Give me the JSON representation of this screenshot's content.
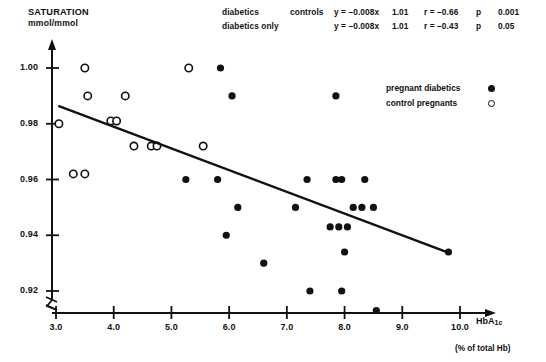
{
  "figure": {
    "y_axis_title": "SATURATION",
    "y_axis_unit": "mmol/mmol",
    "x_axis_title_main": "HbA",
    "x_axis_title_sub": "1c",
    "x_axis_unit": "(% of total Hb)"
  },
  "stats": {
    "rows": [
      {
        "group": "diabetics",
        "group2": "controls",
        "equation": "y = –0.008x",
        "intercept": "1.01",
        "r": "r = –0.66",
        "p_label": "p",
        "p_value": "0.001"
      },
      {
        "group": "diabetics only",
        "group2": "",
        "equation": "y = –0.008x",
        "intercept": "1.01",
        "r": "r = –0.43",
        "p_label": "p",
        "p_value": "0.05"
      }
    ]
  },
  "legend": {
    "items": [
      {
        "label": "pregnant diabetics",
        "marker": "filled-circle"
      },
      {
        "label": "control pregnants",
        "marker": "open-circle"
      }
    ]
  },
  "chart_data": {
    "type": "scatter",
    "title": "",
    "xlabel": "HbA1c (% of total Hb)",
    "ylabel": "SATURATION mmol/mmol",
    "xlim": [
      2.96,
      10.35
    ],
    "ylim": [
      0.9095,
      1.0045
    ],
    "xticks": [
      3.0,
      4.0,
      5.0,
      6.0,
      7.0,
      8.0,
      9.0,
      10.0
    ],
    "xtick_labels": [
      "3.0",
      "4.0",
      "5.0",
      "6.0",
      "7.0",
      "8.0",
      "9.0",
      "10.0"
    ],
    "yticks": [
      0.92,
      0.94,
      0.96,
      0.98,
      1.0
    ],
    "ytick_labels": [
      "0.92",
      "0.94",
      "0.96",
      "0.98",
      "1.00"
    ],
    "grid": false,
    "axis_break": true,
    "legend_position": "upper-right-inside",
    "series": [
      {
        "name": "control pregnants",
        "marker": "open-circle",
        "points": [
          [
            3.5,
            1.0
          ],
          [
            3.55,
            0.99
          ],
          [
            4.2,
            0.99
          ],
          [
            3.05,
            0.98
          ],
          [
            3.95,
            0.981
          ],
          [
            4.05,
            0.981
          ],
          [
            4.35,
            0.972
          ],
          [
            4.65,
            0.972
          ],
          [
            4.75,
            0.972
          ],
          [
            5.3,
            1.0
          ],
          [
            5.55,
            0.972
          ],
          [
            3.3,
            0.962
          ],
          [
            3.5,
            0.962
          ]
        ]
      },
      {
        "name": "pregnant diabetics",
        "marker": "filled-circle",
        "points": [
          [
            5.85,
            1.0
          ],
          [
            6.05,
            0.99
          ],
          [
            7.85,
            0.99
          ],
          [
            5.25,
            0.96
          ],
          [
            5.8,
            0.96
          ],
          [
            7.35,
            0.96
          ],
          [
            7.85,
            0.96
          ],
          [
            7.95,
            0.96
          ],
          [
            8.35,
            0.96
          ],
          [
            6.15,
            0.95
          ],
          [
            7.15,
            0.95
          ],
          [
            8.15,
            0.95
          ],
          [
            8.3,
            0.95
          ],
          [
            8.5,
            0.95
          ],
          [
            5.95,
            0.94
          ],
          [
            7.75,
            0.943
          ],
          [
            7.9,
            0.943
          ],
          [
            8.05,
            0.943
          ],
          [
            6.6,
            0.93
          ],
          [
            8.0,
            0.934
          ],
          [
            9.8,
            0.934
          ],
          [
            7.4,
            0.92
          ],
          [
            7.95,
            0.92
          ],
          [
            8.55,
            0.913
          ]
        ]
      }
    ],
    "regression_line": {
      "name": "diabetics + controls regression",
      "slope": -0.008,
      "intercept": 1.01,
      "x_start": 3.04,
      "y_start": 0.9864,
      "x_end": 9.82,
      "y_end": 0.9336
    }
  }
}
